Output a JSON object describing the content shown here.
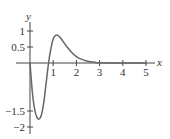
{
  "chart_data": {
    "type": "line",
    "title": "",
    "xlabel": "x",
    "ylabel": "y",
    "xlim": [
      0,
      5.4
    ],
    "ylim": [
      -2.1,
      1.3
    ],
    "grid": false,
    "x_ticks": [
      1,
      2,
      3,
      4,
      5
    ],
    "x_tick_labels": [
      "1",
      "2",
      "3",
      "4",
      "5"
    ],
    "y_ticks": [
      1,
      0.5,
      -1.5,
      -2
    ],
    "y_tick_labels": [
      "1",
      "0.5",
      "−1.5",
      "−2"
    ],
    "series": [
      {
        "name": "f(x)",
        "x": [
          0,
          0.1,
          0.2,
          0.3,
          0.4,
          0.5,
          0.6,
          0.7,
          0.8,
          0.9,
          1.0,
          1.1,
          1.15,
          1.2,
          1.3,
          1.4,
          1.5,
          1.6,
          1.8,
          2.0,
          2.2,
          2.4,
          2.6,
          2.8,
          3.0,
          3.5,
          4.0,
          4.5,
          5.0
        ],
        "y": [
          0,
          -0.9,
          -1.45,
          -1.7,
          -1.75,
          -1.6,
          -1.2,
          -0.6,
          0,
          0.45,
          0.75,
          0.86,
          0.87,
          0.86,
          0.8,
          0.7,
          0.6,
          0.5,
          0.33,
          0.2,
          0.12,
          0.07,
          0.04,
          0.02,
          0.01,
          0.003,
          0.001,
          0,
          0
        ]
      }
    ]
  }
}
